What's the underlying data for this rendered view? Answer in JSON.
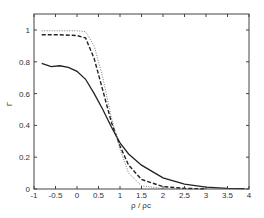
{
  "chart_data": {
    "type": "line",
    "title": "",
    "xlabel": "ρ / ρc",
    "ylabel": "Γ",
    "xlim": [
      -1,
      4
    ],
    "ylim": [
      0,
      1.1
    ],
    "grid": false,
    "legend": null,
    "xticks": [
      "-1",
      "-0.5",
      "0",
      "0.5",
      "1",
      "1.5",
      "2",
      "2.5",
      "3",
      "3.5",
      "4"
    ],
    "yticks": [
      "0",
      "0.2",
      "0.4",
      "0.6",
      "0.8",
      "1"
    ],
    "series": [
      {
        "name": "solid",
        "style": "solid",
        "x": [
          -0.82,
          -0.6,
          -0.4,
          -0.2,
          0,
          0.2,
          0.4,
          0.6,
          0.8,
          1.0,
          1.2,
          1.5,
          2.0,
          2.5,
          3.0,
          3.5,
          3.9
        ],
        "y": [
          0.79,
          0.77,
          0.775,
          0.765,
          0.74,
          0.69,
          0.6,
          0.5,
          0.39,
          0.29,
          0.22,
          0.15,
          0.07,
          0.03,
          0.012,
          0.004,
          0.002
        ]
      },
      {
        "name": "dashed",
        "style": "dashed",
        "x": [
          -0.82,
          -0.4,
          0,
          0.2,
          0.4,
          0.6,
          0.8,
          1.0,
          1.2,
          1.5,
          2.0,
          2.5,
          3.0
        ],
        "y": [
          0.97,
          0.97,
          0.965,
          0.95,
          0.82,
          0.62,
          0.42,
          0.27,
          0.15,
          0.06,
          0.015,
          0.004,
          0.001
        ]
      },
      {
        "name": "dotted",
        "style": "dotted",
        "x": [
          -0.82,
          0,
          0.2,
          0.4,
          0.6,
          0.8,
          1.0,
          1.2,
          1.5,
          2.0
        ],
        "y": [
          0.995,
          0.995,
          0.99,
          0.9,
          0.7,
          0.45,
          0.25,
          0.1,
          0.02,
          0.003
        ]
      }
    ]
  }
}
